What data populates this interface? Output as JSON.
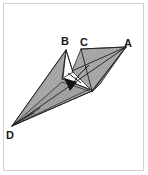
{
  "figure": {
    "kind": "geometry-diagram",
    "background_color": "#ffffff",
    "border_color": "#d0d0d0",
    "fill_color": "#a9a9a9",
    "hatch_color": "#8f8f8f",
    "stroke_color": "#1a1a1a",
    "labels": [
      {
        "id": "A",
        "text": "A",
        "x": 130,
        "y": 46
      },
      {
        "id": "B",
        "text": "B",
        "x": 66,
        "y": 44
      },
      {
        "id": "C",
        "text": "C",
        "x": 84,
        "y": 45
      },
      {
        "id": "D",
        "text": "D",
        "x": 9,
        "y": 137
      }
    ],
    "vertices": {
      "A": {
        "x": 126,
        "y": 47
      },
      "B": {
        "x": 66,
        "y": 50
      },
      "C": {
        "x": 81,
        "y": 49
      },
      "D": {
        "x": 12,
        "y": 126
      },
      "E": {
        "x": 92,
        "y": 91
      },
      "F": {
        "x": 72,
        "y": 71
      },
      "G": {
        "x": 63,
        "y": 77
      },
      "H": {
        "x": 88,
        "y": 65
      }
    },
    "polygons": [
      {
        "name": "left-upper-wing",
        "points": "66,50 63,78 92,91 12,126"
      },
      {
        "name": "lower-band",
        "points": "12,126 63,82 92,92 99,85"
      },
      {
        "name": "right-upper-wing",
        "points": "81,49 126,47 92,91 72,71"
      },
      {
        "name": "right-lower-sliver",
        "points": "126,47 99,85 92,92"
      }
    ],
    "edges": [
      {
        "name": "B-to-D",
        "x1": 66,
        "y1": 50,
        "x2": 12,
        "y2": 126
      },
      {
        "name": "D-to-A",
        "x1": 12,
        "y1": 126,
        "x2": 126,
        "y2": 47
      },
      {
        "name": "C-to-A",
        "x1": 81,
        "y1": 49,
        "x2": 126,
        "y2": 47
      },
      {
        "name": "C-to-E",
        "x1": 81,
        "y1": 49,
        "x2": 92,
        "y2": 91
      },
      {
        "name": "A-to-E",
        "x1": 126,
        "y1": 47,
        "x2": 92,
        "y2": 91
      },
      {
        "name": "D-to-E",
        "x1": 12,
        "y1": 126,
        "x2": 92,
        "y2": 91
      },
      {
        "name": "B-to-F",
        "x1": 66,
        "y1": 50,
        "x2": 73,
        "y2": 72
      },
      {
        "name": "B-to-G",
        "x1": 66,
        "y1": 50,
        "x2": 62,
        "y2": 79
      },
      {
        "name": "crease-mid",
        "x1": 63,
        "y1": 77,
        "x2": 92,
        "y2": 90
      }
    ],
    "fold_arrow": {
      "name": "fold-direction-arrow",
      "path": "M 88,66 Q 78,74 70,87",
      "tick": {
        "x1": 68,
        "y1": 74,
        "x2": 80,
        "y2": 82
      },
      "head": "70,90 65,78 76,82"
    }
  }
}
